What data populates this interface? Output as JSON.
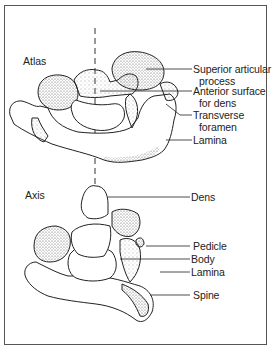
{
  "figure": {
    "atlas": {
      "title": "Atlas",
      "labels": [
        {
          "line1": "Superior articular",
          "line2": "process"
        },
        {
          "line1": "Anterior surface",
          "line2": "for dens"
        },
        {
          "line1": "Transverse",
          "line2": "foramen"
        },
        {
          "line1": "Lamina",
          "line2": ""
        }
      ]
    },
    "axis": {
      "title": "Axis",
      "labels": [
        {
          "line1": "Dens"
        },
        {
          "line1": "Pedicle"
        },
        {
          "line1": "Body"
        },
        {
          "line1": "Lamina"
        },
        {
          "line1": "Spine"
        }
      ]
    },
    "colors": {
      "ink": "#222222",
      "border": "#555555",
      "background": "#ffffff"
    }
  }
}
